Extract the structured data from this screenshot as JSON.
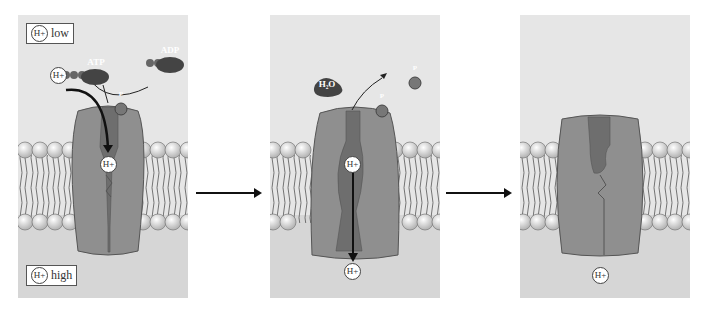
{
  "panels": [
    {
      "id": "step-1",
      "top_label": {
        "ion": "H+",
        "text": "low"
      },
      "bottom_label": {
        "ion": "H+",
        "text": "high"
      },
      "molecules": {
        "atp": "ATP",
        "adp": "ADP",
        "phosphate": "P",
        "ion": "H+"
      }
    },
    {
      "id": "step-2",
      "molecules": {
        "water": "H2O",
        "water_display": "H₂O",
        "phosphate": "P",
        "released_phosphate": "P",
        "ion": "H+"
      }
    },
    {
      "id": "step-3",
      "molecules": {
        "ion": "H+"
      }
    }
  ],
  "ion_label": "H+",
  "colors": {
    "background": "#dcdcdc",
    "protein": "#8f8f8f",
    "channel": "#6e6e6e",
    "lipid_head": "#e8e8e8",
    "arrow": "#111111"
  }
}
